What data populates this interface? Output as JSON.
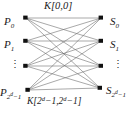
{
  "figure": {
    "type": "bipartite-graph"
  },
  "left_nodes": [
    {
      "id": "p0",
      "base": "P",
      "sub": "0",
      "x": 26,
      "y": 18
    },
    {
      "id": "p1",
      "base": "P",
      "sub": "1",
      "x": 26,
      "y": 41
    },
    {
      "id": "pmid",
      "base": "",
      "sub": "",
      "x": 26,
      "y": 66
    },
    {
      "id": "plast",
      "base": "P",
      "sub": "2^d -1",
      "x": 28,
      "y": 90
    }
  ],
  "right_nodes": [
    {
      "id": "s0",
      "base": "S",
      "sub": "0",
      "x": 101,
      "y": 18
    },
    {
      "id": "s1",
      "base": "S",
      "sub": "1",
      "x": 101,
      "y": 41
    },
    {
      "id": "smid",
      "base": "",
      "sub": "",
      "x": 101,
      "y": 66
    },
    {
      "id": "slast",
      "base": "S",
      "sub": "2^d -1",
      "x": 100,
      "y": 88
    }
  ],
  "labels": {
    "p0": {
      "base": "P",
      "sub": "0"
    },
    "p1": {
      "base": "P",
      "sub": "1"
    },
    "p_last": {
      "base": "P",
      "sub_pre": "2",
      "sub_sup": "d",
      "sub_post": "−1"
    },
    "s0": {
      "base": "S",
      "sub": "0"
    },
    "s1": {
      "base": "S",
      "sub": "1"
    },
    "s_last": {
      "base": "S",
      "sub_pre": "2",
      "sub_sup": "d",
      "sub_post": "−1"
    },
    "k_top": "K[0,0]",
    "k_bottom_prefix": "K[2",
    "k_bottom_sup1": "d",
    "k_bottom_mid": "−1,2",
    "k_bottom_sup2": "d",
    "k_bottom_suffix": "−1]",
    "ellipsis_left": "⋮",
    "ellipsis_right": "⋮"
  },
  "style": {
    "edge_color": "#6e6e6e",
    "node_color": "#111111",
    "background": "#ffffff",
    "text_color": "#1a1a1a"
  },
  "edges_note": "complete bipartite: every left node connects to every right node (16 edges)"
}
